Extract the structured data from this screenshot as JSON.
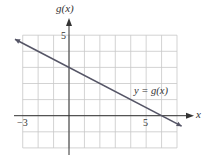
{
  "chart_data": {
    "type": "line",
    "title": "",
    "xlabel": "x",
    "ylabel": "g(x)",
    "xlim": [
      -3,
      7
    ],
    "ylim": [
      -2,
      5
    ],
    "grid": true,
    "x_tick_labels": [
      {
        "value": -3,
        "label": "−3"
      },
      {
        "value": 5,
        "label": "5"
      }
    ],
    "y_tick_labels": [
      {
        "value": 5,
        "label": "5"
      }
    ],
    "series": [
      {
        "name": "y = g(x)",
        "x": [
          -3.5,
          0,
          6,
          7.3
        ],
        "y": [
          4.75,
          3,
          0,
          -0.65
        ],
        "slope": -0.5,
        "intercept": 3,
        "arrows_both_ends": true
      }
    ],
    "annotations": [
      {
        "text": "y = g(x)",
        "x": 5.5,
        "y": 1.2
      }
    ]
  },
  "labels": {
    "y_axis": "g(x)",
    "x_axis": "x",
    "tick_x_neg3": "−3",
    "tick_x_5": "5",
    "tick_y_5": "5",
    "curve_label": "y = g(x)"
  },
  "colors": {
    "grid": "#c8c8c8",
    "axis": "#333333",
    "line": "#555566",
    "text": "#333333"
  }
}
